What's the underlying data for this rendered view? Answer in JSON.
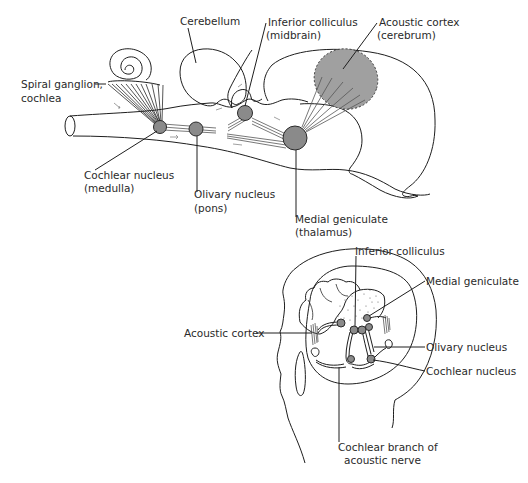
{
  "figure": {
    "top_diagram": {
      "description": "Lateral schematic of the auditory pathway from cochlea to acoustic cortex",
      "labels": {
        "cerebellum": "Cerebellum",
        "inferior_colliculus_1": "Inferior colliculus",
        "inferior_colliculus_2": "(midbrain)",
        "acoustic_cortex_1": "Acoustic cortex",
        "acoustic_cortex_2": "(cerebrum)",
        "spiral_ganglion_1": "Spiral ganglion,",
        "spiral_ganglion_2": "cochlea",
        "cochlear_nucleus_1": "Cochlear nucleus",
        "cochlear_nucleus_2": "(medulla)",
        "olivary_nucleus_1": "Olivary nucleus",
        "olivary_nucleus_2": "(pons)",
        "medial_geniculate_1": "Medial geniculate",
        "medial_geniculate_2": "(thalamus)"
      }
    },
    "bottom_diagram": {
      "description": "Head outline showing auditory pathway within the brain",
      "labels": {
        "inferior_colliculus": "Inferior colliculus",
        "medial_geniculate": "Medial geniculate",
        "acoustic_cortex": "Acoustic cortex",
        "olivary_nucleus": "Olivary nucleus",
        "cochlear_nucleus": "Cochlear nucleus",
        "cochlear_branch_1": "Cochlear branch of",
        "cochlear_branch_2": "acoustic nerve"
      }
    },
    "colors": {
      "ink": "#1e1e1e",
      "nucleus_fill": "#8a8a8a",
      "cortex_fill": "#a0a0a0"
    }
  }
}
